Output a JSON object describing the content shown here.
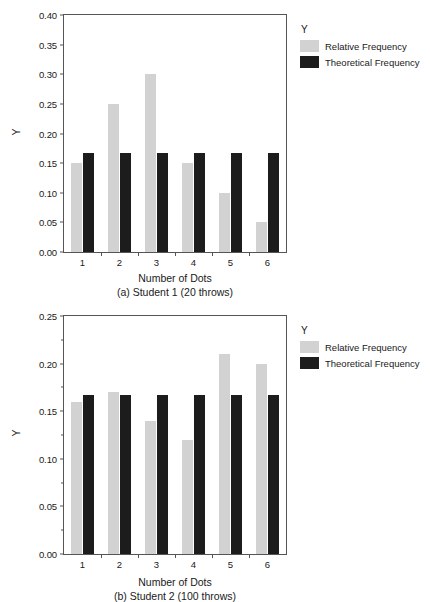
{
  "figure": {
    "background": "#ffffff",
    "colors": {
      "relative_frequency": "#d2d2d2",
      "theoretical_frequency": "#1c1c1c",
      "axis": "#555555",
      "text": "#1a1a1a"
    }
  },
  "legend": {
    "title": "Y",
    "entries": [
      {
        "label": "Relative Frequency",
        "color": "#d2d2d2",
        "swatch": "rel"
      },
      {
        "label": "Theoretical Frequency",
        "color": "#1c1c1c",
        "swatch": "theo"
      }
    ]
  },
  "panels": [
    {
      "id": "a",
      "caption": "(a) Student 1 (20 throws)",
      "xlabel": "Number of Dots",
      "ylabel": "Y",
      "yticks": [
        "0.00",
        "0.05",
        "0.10",
        "0.15",
        "0.20",
        "0.25",
        "0.30",
        "0.35",
        "0.40"
      ],
      "xticks": [
        "1",
        "2",
        "3",
        "4",
        "5",
        "6"
      ]
    },
    {
      "id": "b",
      "caption": "(b) Student 2 (100 throws)",
      "xlabel": "Number of Dots",
      "ylabel": "Y",
      "yticks": [
        "0.00",
        "0.05",
        "0.10",
        "0.15",
        "0.20",
        "0.25"
      ],
      "xticks": [
        "1",
        "2",
        "3",
        "4",
        "5",
        "6"
      ]
    }
  ],
  "chart_data": [
    {
      "type": "bar",
      "title": "(a) Student 1 (20 throws)",
      "xlabel": "Number of Dots",
      "ylabel": "Y",
      "categories": [
        "1",
        "2",
        "3",
        "4",
        "5",
        "6"
      ],
      "series": [
        {
          "name": "Relative Frequency",
          "color": "#d2d2d2",
          "values": [
            0.15,
            0.25,
            0.3,
            0.15,
            0.1,
            0.05
          ]
        },
        {
          "name": "Theoretical Frequency",
          "color": "#1c1c1c",
          "values": [
            0.167,
            0.167,
            0.167,
            0.167,
            0.167,
            0.167
          ]
        }
      ],
      "ylim": [
        0.0,
        0.4
      ],
      "ytick_step": 0.05,
      "ytick_labels": [
        "0.00",
        "0.05",
        "0.10",
        "0.15",
        "0.20",
        "0.25",
        "0.30",
        "0.35",
        "0.40"
      ],
      "minor_ticks": false,
      "grid": false,
      "legend_title": "Y",
      "legend_position": "right"
    },
    {
      "type": "bar",
      "title": "(b) Student 2 (100 throws)",
      "xlabel": "Number of Dots",
      "ylabel": "Y",
      "categories": [
        "1",
        "2",
        "3",
        "4",
        "5",
        "6"
      ],
      "series": [
        {
          "name": "Relative Frequency",
          "color": "#d2d2d2",
          "values": [
            0.16,
            0.17,
            0.14,
            0.12,
            0.21,
            0.2
          ]
        },
        {
          "name": "Theoretical Frequency",
          "color": "#1c1c1c",
          "values": [
            0.167,
            0.167,
            0.167,
            0.167,
            0.167,
            0.167
          ]
        }
      ],
      "ylim": [
        0.0,
        0.25
      ],
      "ytick_step": 0.05,
      "ytick_labels": [
        "0.00",
        "0.05",
        "0.10",
        "0.15",
        "0.20",
        "0.25"
      ],
      "minor_ticks": true,
      "minor_tick_step": 0.025,
      "grid": false,
      "legend_title": "Y",
      "legend_position": "right"
    }
  ]
}
